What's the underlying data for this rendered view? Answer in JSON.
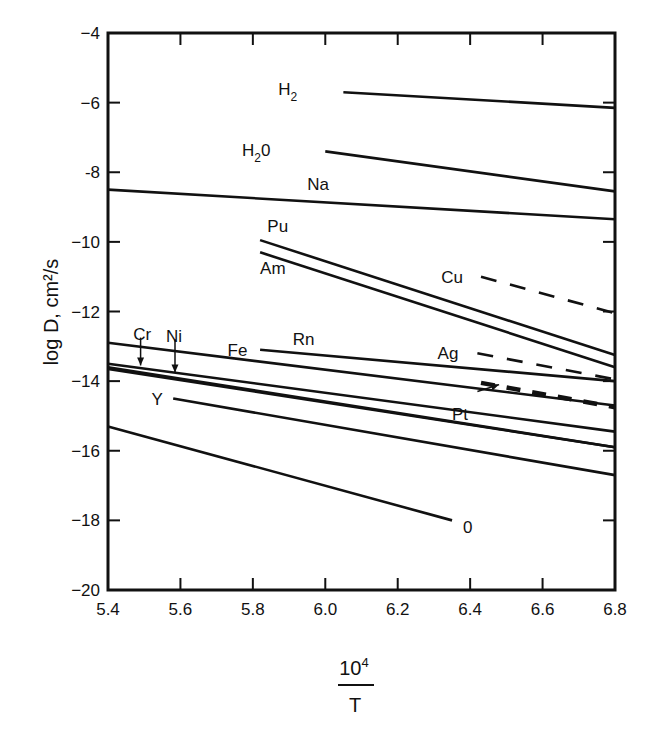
{
  "chart_data": {
    "type": "line",
    "title": "",
    "xlabel": "10^4 / T",
    "xlabel_numerator": "10",
    "xlabel_exponent": "4",
    "xlabel_denominator": "T",
    "ylabel": "log D, cm²/s",
    "xlim": [
      5.4,
      6.8
    ],
    "ylim": [
      -20,
      -4
    ],
    "x_ticks": [
      5.4,
      5.6,
      5.8,
      6.0,
      6.2,
      6.4,
      6.6,
      6.8
    ],
    "x_tick_labels": [
      "5.4",
      "5.6",
      "5.8",
      "6.0",
      "6.2",
      "6.4",
      "6.6",
      "6.8"
    ],
    "y_ticks": [
      -4,
      -6,
      -8,
      -10,
      -12,
      -14,
      -16,
      -18,
      -20
    ],
    "y_tick_labels": [
      "−4",
      "−6",
      "-8",
      "−10",
      "−12",
      "−14",
      "−16",
      "−18",
      "−20"
    ],
    "grid": false,
    "legend": "inline labels",
    "series": [
      {
        "name": "H2",
        "label": "H",
        "sub": "2",
        "style": "solid",
        "x": [
          6.05,
          6.8
        ],
        "y": [
          -5.7,
          -6.15
        ],
        "label_pos": [
          5.87,
          -5.6
        ]
      },
      {
        "name": "H2O",
        "label": "H",
        "sub": "2",
        "suffix": "0",
        "style": "solid",
        "x": [
          6.0,
          6.8
        ],
        "y": [
          -7.4,
          -8.55
        ],
        "label_pos": [
          5.77,
          -7.35
        ]
      },
      {
        "name": "Na",
        "label": "Na",
        "style": "solid",
        "x": [
          5.4,
          6.8
        ],
        "y": [
          -8.5,
          -9.35
        ],
        "label_pos": [
          5.95,
          -8.35
        ]
      },
      {
        "name": "Pu",
        "label": "Pu",
        "style": "solid",
        "x": [
          5.82,
          6.8
        ],
        "y": [
          -9.95,
          -13.25
        ],
        "label_pos": [
          5.84,
          -9.55
        ]
      },
      {
        "name": "Am",
        "label": "Am",
        "style": "solid",
        "x": [
          5.82,
          6.8
        ],
        "y": [
          -10.3,
          -13.6
        ],
        "label_pos": [
          5.82,
          -10.75
        ]
      },
      {
        "name": "Cu",
        "label": "Cu",
        "style": "dashed",
        "x": [
          6.43,
          6.8
        ],
        "y": [
          -11.0,
          -12.05
        ],
        "label_pos": [
          6.32,
          -11.0
        ]
      },
      {
        "name": "Fe",
        "label": "Fe",
        "style": "solid",
        "x": [
          5.4,
          6.8
        ],
        "y": [
          -12.9,
          -14.7
        ],
        "label_pos": [
          5.73,
          -13.1
        ]
      },
      {
        "name": "Rn",
        "label": "Rn",
        "style": "solid",
        "x": [
          5.82,
          6.8
        ],
        "y": [
          -13.1,
          -14.0
        ],
        "label_pos": [
          5.91,
          -12.8
        ]
      },
      {
        "name": "Ag",
        "label": "Ag",
        "style": "dashed",
        "x": [
          6.42,
          6.8
        ],
        "y": [
          -13.2,
          -13.95
        ],
        "label_pos": [
          6.31,
          -13.2
        ]
      },
      {
        "name": "Ag-lower",
        "label": "",
        "style": "dashed-bold",
        "x": [
          6.43,
          6.8
        ],
        "y": [
          -14.05,
          -14.75
        ]
      },
      {
        "name": "Cr",
        "label": "Cr",
        "style": "solid",
        "x": [
          5.4,
          6.8
        ],
        "y": [
          -13.5,
          -15.45
        ],
        "label_pos": [
          5.47,
          -12.65
        ]
      },
      {
        "name": "Ni",
        "label": "Ni",
        "style": "solid",
        "x": [
          5.4,
          6.8
        ],
        "y": [
          -13.65,
          -15.9
        ],
        "label_pos": [
          5.56,
          -12.7
        ]
      },
      {
        "name": "Pt",
        "label": "Pt",
        "style": "solid",
        "x": [
          5.4,
          6.8
        ],
        "y": [
          -13.6,
          -15.9
        ],
        "label_pos": [
          6.35,
          -14.95
        ]
      },
      {
        "name": "Y",
        "label": "Y",
        "style": "solid",
        "x": [
          5.58,
          6.8
        ],
        "y": [
          -14.5,
          -16.7
        ],
        "label_pos": [
          5.52,
          -14.5
        ]
      },
      {
        "name": "O",
        "label": "0",
        "style": "solid",
        "x": [
          5.4,
          6.35
        ],
        "y": [
          -15.3,
          -18.0
        ],
        "label_pos": [
          6.38,
          -18.2
        ]
      }
    ],
    "annotations": [
      {
        "type": "arrow",
        "target": "Cr",
        "from": [
          5.49,
          -12.75
        ],
        "to": [
          5.49,
          -13.55
        ]
      },
      {
        "type": "arrow",
        "target": "Ni",
        "from": [
          5.585,
          -12.8
        ],
        "to": [
          5.585,
          -13.75
        ]
      },
      {
        "type": "arrow",
        "target": "Ag-lower",
        "from": [
          6.42,
          -14.3
        ],
        "to": [
          6.48,
          -14.1
        ]
      }
    ]
  }
}
